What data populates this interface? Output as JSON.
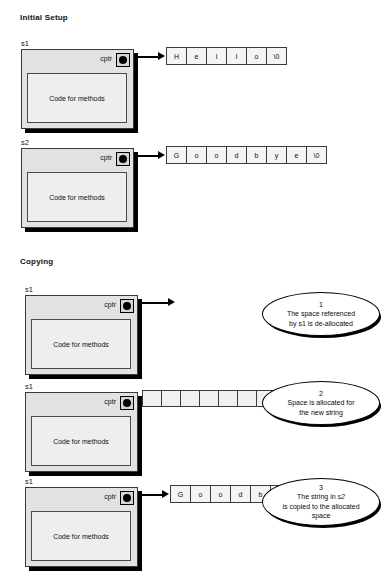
{
  "diagram": {
    "title_initial": "Initial Setup",
    "title_copying": "Copying"
  },
  "labels": {
    "cptr": "cptr",
    "methods": "Code for methods",
    "s1": "s1",
    "s2": "s2"
  },
  "strings": {
    "hello": [
      "H",
      "e",
      "l",
      "l",
      "o",
      "\\0"
    ],
    "goodbye": [
      "G",
      "o",
      "o",
      "d",
      "b",
      "y",
      "e",
      "\\0"
    ],
    "empty": [
      "",
      "",
      "",
      "",
      "",
      "",
      "",
      ""
    ]
  },
  "notes": [
    {
      "number": "1",
      "line1": "The space referenced",
      "line2": "by s1 is de-allocated",
      "line3": ""
    },
    {
      "number": "2",
      "line1": "Space is allocated for",
      "line2": "the new string",
      "line3": ""
    },
    {
      "number": "3",
      "line1": "The string in s2",
      "line2": "is copied to the allocated",
      "line3": "space"
    }
  ],
  "colors": {
    "object_fill": "#e2e2e2",
    "methods_fill": "#eeeeee",
    "cell_fill": "#f4f4f4",
    "outline": "#000000"
  }
}
